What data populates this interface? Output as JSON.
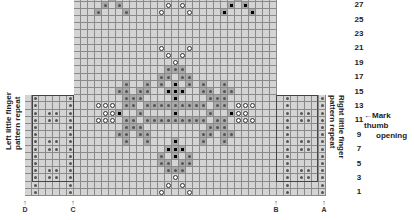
{
  "chart": {
    "row_labels": [
      "1",
      "3",
      "5",
      "7",
      "9",
      "11",
      "13",
      "15",
      "17",
      "19",
      "21",
      "23",
      "25",
      "27"
    ],
    "left_label": {
      "line1": "Left little finger",
      "line2": "pattern repeat"
    },
    "right_label": {
      "line1": "Right little finger",
      "line2": "pattern repeat"
    },
    "annotation": {
      "arrow": "←",
      "line1": "Mark thumb",
      "line2": "opening"
    },
    "markers": [
      {
        "letter": "D",
        "x": 25
      },
      {
        "letter": "C",
        "x": 73
      },
      {
        "letter": "B",
        "x": 276
      },
      {
        "letter": "A",
        "x": 324
      }
    ],
    "marker_arrow": "↑"
  },
  "grid": {
    "origin_x": 25,
    "bottom_y": 196,
    "cell_w": 7,
    "cell_h": 7.2,
    "left_panel": {
      "col_start": 0,
      "cols": 7,
      "rows": 14
    },
    "center_panel": {
      "col_start": 7,
      "cols": 29,
      "rows": 28
    },
    "right_panel": {
      "col_start": 36,
      "cols": 7,
      "rows": 14
    },
    "symbols": [
      {
        "c": 1,
        "r": 1,
        "s": "dot"
      },
      {
        "c": 1,
        "r": 2,
        "s": "dot"
      },
      {
        "c": 1,
        "r": 3,
        "s": "dot"
      },
      {
        "c": 1,
        "r": 4,
        "s": "dot"
      },
      {
        "c": 1,
        "r": 5,
        "s": "dot"
      },
      {
        "c": 1,
        "r": 6,
        "s": "dot"
      },
      {
        "c": 1,
        "r": 7,
        "s": "dot"
      },
      {
        "c": 1,
        "r": 8,
        "s": "dot"
      },
      {
        "c": 1,
        "r": 9,
        "s": "dot"
      },
      {
        "c": 1,
        "r": 10,
        "s": "dot"
      },
      {
        "c": 1,
        "r": 11,
        "s": "dot"
      },
      {
        "c": 1,
        "r": 12,
        "s": "dot"
      },
      {
        "c": 1,
        "r": 13,
        "s": "dot"
      },
      {
        "c": 1,
        "r": 14,
        "s": "dot"
      },
      {
        "c": 6,
        "r": 1,
        "s": "dot"
      },
      {
        "c": 6,
        "r": 2,
        "s": "dot"
      },
      {
        "c": 6,
        "r": 3,
        "s": "dot"
      },
      {
        "c": 6,
        "r": 4,
        "s": "dot"
      },
      {
        "c": 6,
        "r": 5,
        "s": "dot"
      },
      {
        "c": 6,
        "r": 6,
        "s": "dot"
      },
      {
        "c": 6,
        "r": 7,
        "s": "dot"
      },
      {
        "c": 6,
        "r": 8,
        "s": "dot"
      },
      {
        "c": 6,
        "r": 9,
        "s": "dot"
      },
      {
        "c": 6,
        "r": 10,
        "s": "dot"
      },
      {
        "c": 6,
        "r": 11,
        "s": "dot"
      },
      {
        "c": 6,
        "r": 12,
        "s": "dot"
      },
      {
        "c": 6,
        "r": 13,
        "s": "dot"
      },
      {
        "c": 6,
        "r": 14,
        "s": "dot"
      },
      {
        "c": 3,
        "r": 3,
        "s": "dot"
      },
      {
        "c": 4,
        "r": 3,
        "s": "dot"
      },
      {
        "c": 3,
        "r": 4,
        "s": "dot"
      },
      {
        "c": 4,
        "r": 4,
        "s": "dot"
      },
      {
        "c": 3,
        "r": 7,
        "s": "dot"
      },
      {
        "c": 4,
        "r": 7,
        "s": "dot"
      },
      {
        "c": 3,
        "r": 8,
        "s": "dot"
      },
      {
        "c": 4,
        "r": 8,
        "s": "dot"
      },
      {
        "c": 3,
        "r": 11,
        "s": "dot"
      },
      {
        "c": 4,
        "r": 11,
        "s": "dot"
      },
      {
        "c": 3,
        "r": 12,
        "s": "dot"
      },
      {
        "c": 4,
        "r": 12,
        "s": "dot"
      },
      {
        "c": 37,
        "r": 1,
        "s": "dot"
      },
      {
        "c": 37,
        "r": 2,
        "s": "dot"
      },
      {
        "c": 37,
        "r": 3,
        "s": "dot"
      },
      {
        "c": 37,
        "r": 4,
        "s": "dot"
      },
      {
        "c": 37,
        "r": 5,
        "s": "dot"
      },
      {
        "c": 37,
        "r": 6,
        "s": "dot"
      },
      {
        "c": 37,
        "r": 7,
        "s": "dot"
      },
      {
        "c": 37,
        "r": 8,
        "s": "dot"
      },
      {
        "c": 37,
        "r": 9,
        "s": "dot"
      },
      {
        "c": 37,
        "r": 10,
        "s": "dot"
      },
      {
        "c": 37,
        "r": 11,
        "s": "dot"
      },
      {
        "c": 37,
        "r": 12,
        "s": "dot"
      },
      {
        "c": 37,
        "r": 13,
        "s": "dot"
      },
      {
        "c": 37,
        "r": 14,
        "s": "dot"
      },
      {
        "c": 42,
        "r": 1,
        "s": "dot"
      },
      {
        "c": 42,
        "r": 2,
        "s": "dot"
      },
      {
        "c": 42,
        "r": 3,
        "s": "dot"
      },
      {
        "c": 42,
        "r": 4,
        "s": "dot"
      },
      {
        "c": 42,
        "r": 5,
        "s": "dot"
      },
      {
        "c": 42,
        "r": 6,
        "s": "dot"
      },
      {
        "c": 42,
        "r": 7,
        "s": "dot"
      },
      {
        "c": 42,
        "r": 8,
        "s": "dot"
      },
      {
        "c": 42,
        "r": 9,
        "s": "dot"
      },
      {
        "c": 42,
        "r": 10,
        "s": "dot"
      },
      {
        "c": 42,
        "r": 11,
        "s": "dot"
      },
      {
        "c": 42,
        "r": 12,
        "s": "dot"
      },
      {
        "c": 42,
        "r": 13,
        "s": "dot"
      },
      {
        "c": 42,
        "r": 14,
        "s": "dot"
      },
      {
        "c": 39,
        "r": 3,
        "s": "dot"
      },
      {
        "c": 40,
        "r": 3,
        "s": "dot"
      },
      {
        "c": 39,
        "r": 4,
        "s": "dot"
      },
      {
        "c": 40,
        "r": 4,
        "s": "dot"
      },
      {
        "c": 39,
        "r": 7,
        "s": "dot"
      },
      {
        "c": 40,
        "r": 7,
        "s": "dot"
      },
      {
        "c": 39,
        "r": 8,
        "s": "dot"
      },
      {
        "c": 40,
        "r": 8,
        "s": "dot"
      },
      {
        "c": 39,
        "r": 11,
        "s": "dot"
      },
      {
        "c": 40,
        "r": 11,
        "s": "dot"
      },
      {
        "c": 39,
        "r": 12,
        "s": "dot"
      },
      {
        "c": 40,
        "r": 12,
        "s": "dot"
      },
      {
        "c": 19,
        "r": 1,
        "s": "ring"
      },
      {
        "c": 23,
        "r": 1,
        "s": "ring"
      },
      {
        "c": 20,
        "r": 2,
        "s": "ring"
      },
      {
        "c": 22,
        "r": 2,
        "s": "ring"
      },
      {
        "c": 21,
        "r": 3,
        "s": "ring"
      },
      {
        "c": 20,
        "r": 4,
        "s": "dot",
        "m": 1
      },
      {
        "c": 21,
        "r": 4,
        "s": "dot",
        "m": 1
      },
      {
        "c": 22,
        "r": 4,
        "s": "dot",
        "m": 1
      },
      {
        "c": 19,
        "r": 5,
        "s": "dot",
        "m": 1
      },
      {
        "c": 20,
        "r": 5,
        "s": "dot",
        "m": 1
      },
      {
        "c": 22,
        "r": 5,
        "s": "dot",
        "m": 1
      },
      {
        "c": 23,
        "r": 5,
        "s": "dot",
        "m": 1
      },
      {
        "c": 19,
        "r": 6,
        "s": "dot",
        "m": 1
      },
      {
        "c": 21,
        "r": 6,
        "s": "black",
        "m": 1
      },
      {
        "c": 23,
        "r": 6,
        "s": "dot",
        "m": 1
      },
      {
        "c": 20,
        "r": 7,
        "s": "black",
        "m": 1
      },
      {
        "c": 21,
        "r": 7,
        "s": "black",
        "m": 1
      },
      {
        "c": 22,
        "r": 7,
        "s": "black",
        "m": 1
      },
      {
        "c": 21,
        "r": 8,
        "s": "black",
        "m": 1
      },
      {
        "c": 14,
        "r": 8,
        "s": "dot",
        "m": 1
      },
      {
        "c": 17,
        "r": 8,
        "s": "dot",
        "m": 1
      },
      {
        "c": 25,
        "r": 8,
        "s": "dot",
        "m": 1
      },
      {
        "c": 28,
        "r": 8,
        "s": "dot",
        "m": 1
      },
      {
        "c": 13,
        "r": 9,
        "s": "dot",
        "m": 1
      },
      {
        "c": 14,
        "r": 9,
        "s": "dot",
        "m": 1
      },
      {
        "c": 16,
        "r": 9,
        "s": "dot",
        "m": 1
      },
      {
        "c": 17,
        "r": 9,
        "s": "dot",
        "m": 1
      },
      {
        "c": 25,
        "r": 9,
        "s": "dot",
        "m": 1
      },
      {
        "c": 26,
        "r": 9,
        "s": "dot",
        "m": 1
      },
      {
        "c": 28,
        "r": 9,
        "s": "dot",
        "m": 1
      },
      {
        "c": 29,
        "r": 9,
        "s": "dot",
        "m": 1
      },
      {
        "c": 14,
        "r": 10,
        "s": "dot",
        "m": 1
      },
      {
        "c": 15,
        "r": 10,
        "s": "dot",
        "m": 1
      },
      {
        "c": 16,
        "r": 10,
        "s": "dot",
        "m": 1
      },
      {
        "c": 26,
        "r": 10,
        "s": "dot",
        "m": 1
      },
      {
        "c": 27,
        "r": 10,
        "s": "dot",
        "m": 1
      },
      {
        "c": 28,
        "r": 10,
        "s": "dot",
        "m": 1
      },
      {
        "c": 10,
        "r": 11,
        "s": "ring"
      },
      {
        "c": 11,
        "r": 11,
        "s": "ring"
      },
      {
        "c": 12,
        "r": 11,
        "s": "ring"
      },
      {
        "c": 14,
        "r": 11,
        "s": "dot",
        "m": 1
      },
      {
        "c": 15,
        "r": 11,
        "s": "dot",
        "m": 1
      },
      {
        "c": 17,
        "r": 11,
        "s": "dot",
        "m": 1
      },
      {
        "c": 18,
        "r": 11,
        "s": "dot",
        "m": 1
      },
      {
        "c": 19,
        "r": 11,
        "s": "dot",
        "m": 1
      },
      {
        "c": 20,
        "r": 11,
        "s": "dot",
        "m": 1
      },
      {
        "c": 21,
        "r": 11,
        "s": "dot",
        "m": 1
      },
      {
        "c": 22,
        "r": 11,
        "s": "dot",
        "m": 1
      },
      {
        "c": 23,
        "r": 11,
        "s": "dot",
        "m": 1
      },
      {
        "c": 24,
        "r": 11,
        "s": "dot",
        "m": 1
      },
      {
        "c": 25,
        "r": 11,
        "s": "dot",
        "m": 1
      },
      {
        "c": 27,
        "r": 11,
        "s": "dot",
        "m": 1
      },
      {
        "c": 28,
        "r": 11,
        "s": "dot",
        "m": 1
      },
      {
        "c": 30,
        "r": 11,
        "s": "ring"
      },
      {
        "c": 31,
        "r": 11,
        "s": "ring"
      },
      {
        "c": 32,
        "r": 11,
        "s": "ring"
      },
      {
        "c": 11,
        "r": 12,
        "s": "ring"
      },
      {
        "c": 12,
        "r": 12,
        "s": "ring"
      },
      {
        "c": 13,
        "r": 12,
        "s": "black",
        "m": 1
      },
      {
        "c": 16,
        "r": 12,
        "s": "dot",
        "m": 1
      },
      {
        "c": 21,
        "r": 12,
        "s": "black",
        "m": 1
      },
      {
        "c": 26,
        "r": 12,
        "s": "dot",
        "m": 1
      },
      {
        "c": 29,
        "r": 12,
        "s": "black",
        "m": 1
      },
      {
        "c": 30,
        "r": 12,
        "s": "ring"
      },
      {
        "c": 31,
        "r": 12,
        "s": "ring"
      },
      {
        "c": 10,
        "r": 13,
        "s": "ring"
      },
      {
        "c": 11,
        "r": 13,
        "s": "ring"
      },
      {
        "c": 12,
        "r": 13,
        "s": "ring"
      },
      {
        "c": 14,
        "r": 13,
        "s": "dot",
        "m": 1
      },
      {
        "c": 15,
        "r": 13,
        "s": "dot",
        "m": 1
      },
      {
        "c": 17,
        "r": 13,
        "s": "dot",
        "m": 1
      },
      {
        "c": 18,
        "r": 13,
        "s": "dot",
        "m": 1
      },
      {
        "c": 19,
        "r": 13,
        "s": "dot",
        "m": 1
      },
      {
        "c": 20,
        "r": 13,
        "s": "dot",
        "m": 1
      },
      {
        "c": 21,
        "r": 13,
        "s": "dot",
        "m": 1
      },
      {
        "c": 22,
        "r": 13,
        "s": "dot",
        "m": 1
      },
      {
        "c": 23,
        "r": 13,
        "s": "dot",
        "m": 1
      },
      {
        "c": 24,
        "r": 13,
        "s": "dot",
        "m": 1
      },
      {
        "c": 25,
        "r": 13,
        "s": "dot",
        "m": 1
      },
      {
        "c": 27,
        "r": 13,
        "s": "dot",
        "m": 1
      },
      {
        "c": 28,
        "r": 13,
        "s": "dot",
        "m": 1
      },
      {
        "c": 30,
        "r": 13,
        "s": "ring"
      },
      {
        "c": 31,
        "r": 13,
        "s": "ring"
      },
      {
        "c": 32,
        "r": 13,
        "s": "ring"
      },
      {
        "c": 14,
        "r": 14,
        "s": "dot",
        "m": 1
      },
      {
        "c": 15,
        "r": 14,
        "s": "dot",
        "m": 1
      },
      {
        "c": 16,
        "r": 14,
        "s": "dot",
        "m": 1
      },
      {
        "c": 26,
        "r": 14,
        "s": "dot",
        "m": 1
      },
      {
        "c": 27,
        "r": 14,
        "s": "dot",
        "m": 1
      },
      {
        "c": 28,
        "r": 14,
        "s": "dot",
        "m": 1
      },
      {
        "c": 13,
        "r": 15,
        "s": "dot",
        "m": 1
      },
      {
        "c": 14,
        "r": 15,
        "s": "dot",
        "m": 1
      },
      {
        "c": 16,
        "r": 15,
        "s": "dot",
        "m": 1
      },
      {
        "c": 17,
        "r": 15,
        "s": "dot",
        "m": 1
      },
      {
        "c": 21,
        "r": 14,
        "s": "black",
        "m": 1
      },
      {
        "c": 25,
        "r": 15,
        "s": "dot",
        "m": 1
      },
      {
        "c": 26,
        "r": 15,
        "s": "dot",
        "m": 1
      },
      {
        "c": 28,
        "r": 15,
        "s": "dot",
        "m": 1
      },
      {
        "c": 29,
        "r": 15,
        "s": "dot",
        "m": 1
      },
      {
        "c": 14,
        "r": 16,
        "s": "dot",
        "m": 1
      },
      {
        "c": 17,
        "r": 16,
        "s": "dot",
        "m": 1
      },
      {
        "c": 20,
        "r": 15,
        "s": "black",
        "m": 1
      },
      {
        "c": 21,
        "r": 15,
        "s": "black",
        "m": 1
      },
      {
        "c": 22,
        "r": 15,
        "s": "black",
        "m": 1
      },
      {
        "c": 25,
        "r": 16,
        "s": "dot",
        "m": 1
      },
      {
        "c": 28,
        "r": 16,
        "s": "dot",
        "m": 1
      },
      {
        "c": 21,
        "r": 16,
        "s": "black",
        "m": 1
      },
      {
        "c": 19,
        "r": 16,
        "s": "dot",
        "m": 1
      },
      {
        "c": 23,
        "r": 16,
        "s": "dot",
        "m": 1
      },
      {
        "c": 19,
        "r": 17,
        "s": "dot",
        "m": 1
      },
      {
        "c": 20,
        "r": 17,
        "s": "dot",
        "m": 1
      },
      {
        "c": 22,
        "r": 17,
        "s": "dot",
        "m": 1
      },
      {
        "c": 23,
        "r": 17,
        "s": "dot",
        "m": 1
      },
      {
        "c": 20,
        "r": 18,
        "s": "dot",
        "m": 1
      },
      {
        "c": 21,
        "r": 18,
        "s": "dot",
        "m": 1
      },
      {
        "c": 22,
        "r": 18,
        "s": "dot",
        "m": 1
      },
      {
        "c": 21,
        "r": 19,
        "s": "ring"
      },
      {
        "c": 20,
        "r": 20,
        "s": "ring"
      },
      {
        "c": 22,
        "r": 20,
        "s": "ring"
      },
      {
        "c": 19,
        "r": 21,
        "s": "ring"
      },
      {
        "c": 23,
        "r": 21,
        "s": "ring"
      },
      {
        "c": 10,
        "r": 26,
        "s": "dot",
        "m": 1
      },
      {
        "c": 14,
        "r": 26,
        "s": "dot",
        "m": 1
      },
      {
        "c": 11,
        "r": 27,
        "s": "dot",
        "m": 1
      },
      {
        "c": 13,
        "r": 27,
        "s": "dot",
        "m": 1
      },
      {
        "c": 12,
        "r": 28,
        "s": "dot",
        "m": 1
      },
      {
        "c": 19,
        "r": 26,
        "s": "ring"
      },
      {
        "c": 23,
        "r": 26,
        "s": "ring"
      },
      {
        "c": 20,
        "r": 27,
        "s": "ring"
      },
      {
        "c": 22,
        "r": 27,
        "s": "ring"
      },
      {
        "c": 21,
        "r": 28,
        "s": "ring"
      },
      {
        "c": 28,
        "r": 26,
        "s": "black",
        "m": 1
      },
      {
        "c": 32,
        "r": 26,
        "s": "black",
        "m": 1
      },
      {
        "c": 29,
        "r": 27,
        "s": "black",
        "m": 1
      },
      {
        "c": 31,
        "r": 27,
        "s": "black",
        "m": 1
      },
      {
        "c": 30,
        "r": 28,
        "s": "black",
        "m": 1
      }
    ]
  }
}
